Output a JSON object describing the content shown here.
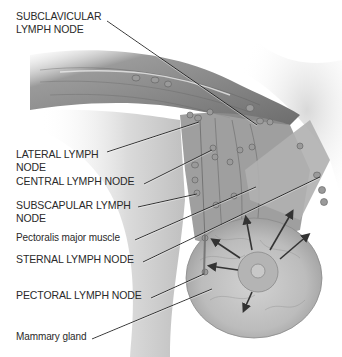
{
  "diagram": {
    "labels": [
      {
        "id": "subclavicular",
        "text": "SUBCLAVICULAR\nLYMPH NODE",
        "x": 16,
        "y": 10,
        "line": [
          [
            107,
            21
          ],
          [
            257,
            125
          ]
        ]
      },
      {
        "id": "lateral",
        "text": "LATERAL LYMPH\nNODE",
        "x": 16,
        "y": 148,
        "line": [
          [
            107,
            152
          ],
          [
            199,
            122
          ]
        ]
      },
      {
        "id": "central",
        "text": "CENTRAL LYMPH NODE",
        "x": 16,
        "y": 175,
        "line": [
          [
            144,
            184
          ],
          [
            212,
            150
          ]
        ]
      },
      {
        "id": "subscapular",
        "text": "SUBSCAPULAR LYMPH\nNODE",
        "x": 16,
        "y": 199,
        "line": [
          [
            138,
            207
          ],
          [
            197,
            194
          ]
        ]
      },
      {
        "id": "pectoralis-major",
        "text": "Pectoralis major muscle",
        "x": 16,
        "y": 232,
        "line": [
          [
            135,
            240
          ],
          [
            256,
            187
          ]
        ]
      },
      {
        "id": "sternal",
        "text": "STERNAL LYMPH NODE",
        "x": 16,
        "y": 253,
        "line": [
          [
            143,
            262
          ],
          [
            320,
            177
          ]
        ]
      },
      {
        "id": "pectoral",
        "text": "PECTORAL LYMPH NODE",
        "x": 16,
        "y": 289,
        "line": [
          [
            151,
            298
          ],
          [
            204,
            274
          ]
        ]
      },
      {
        "id": "mammary-gland",
        "text": "Mammary gland",
        "x": 16,
        "y": 331,
        "line": [
          [
            92,
            339
          ],
          [
            212,
            289
          ]
        ]
      }
    ],
    "colors": {
      "label_text": "#2a2a2a",
      "leader_line": "#1e1e1e",
      "muscle_dark": "#6b6b6b",
      "muscle_light": "#b9b9b9",
      "node": "#8a8a8a",
      "arrow": "#333333"
    }
  }
}
